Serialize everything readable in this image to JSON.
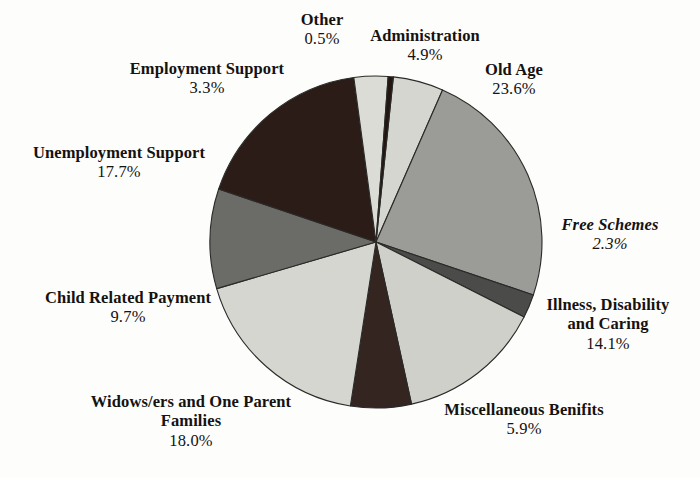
{
  "chart_data": {
    "type": "pie",
    "title": "",
    "subtitle": "",
    "xlabel": "",
    "ylabel": "",
    "legend_position": "none",
    "grid": false,
    "unit": "%",
    "center": {
      "x": 376,
      "y": 242,
      "r": 166
    },
    "start_angle_deg": -84,
    "direction": "clockwise",
    "categories": [
      "Administration",
      "Old Age",
      "Free Schemes",
      "Illness, Disability and Caring",
      "Miscellaneous Benifits",
      "Widows/ers and One Parent Families",
      "Child Related Payment",
      "Unemployment Support",
      "Employment Support",
      "Other"
    ],
    "values": [
      4.9,
      23.6,
      2.3,
      14.1,
      5.9,
      18.0,
      9.7,
      17.7,
      3.3,
      0.5
    ],
    "slices": [
      {
        "label": "Administration",
        "value": 4.9,
        "percent": "4.9%",
        "color": "#d6d6d1"
      },
      {
        "label": "Old Age",
        "value": 23.6,
        "percent": "23.6%",
        "color": "#9b9b98"
      },
      {
        "label": "Free Schemes",
        "value": 2.3,
        "percent": "2.3%",
        "color": "#4b4b49"
      },
      {
        "label": "Illness, Disability and Caring",
        "value": 14.1,
        "percent": "14.1%",
        "color": "#d0d0cb"
      },
      {
        "label": "Miscellaneous Benifits",
        "value": 5.9,
        "percent": "5.9%",
        "color": "#342520"
      },
      {
        "label": "Widows/ers and One Parent Families",
        "value": 18.0,
        "percent": "18.0%",
        "color": "#d6d6d1"
      },
      {
        "label": "Child Related Payment",
        "value": 9.7,
        "percent": "9.7%",
        "color": "#6b6b68"
      },
      {
        "label": "Unemployment Support",
        "value": 17.7,
        "percent": "17.7%",
        "color": "#2b1c17"
      },
      {
        "label": "Employment Support",
        "value": 3.3,
        "percent": "3.3%",
        "color": "#dcdcd7"
      },
      {
        "label": "Other",
        "value": 0.5,
        "percent": "0.5%",
        "color": "#231610"
      }
    ]
  },
  "labels": {
    "other": {
      "name": "Other",
      "pct": "0.5%"
    },
    "administration": {
      "name": "Administration",
      "pct": "4.9%"
    },
    "old_age": {
      "name": "Old Age",
      "pct": "23.6%"
    },
    "employment": {
      "name": "Employment Support",
      "pct": "3.3%"
    },
    "unemployment": {
      "name": "Unemployment Support",
      "pct": "17.7%"
    },
    "child_related": {
      "name": "Child Related Payment",
      "pct": "9.7%"
    },
    "widows": {
      "name": "Widows/ers and One Parent\nFamilies",
      "pct": "18.0%"
    },
    "misc": {
      "name": "Miscellaneous Benifits",
      "pct": "5.9%"
    },
    "illness": {
      "name": "Illness, Disability\nand Caring",
      "pct": "14.1%"
    },
    "free_schemes": {
      "name": "Free Schemes",
      "pct": "2.3%"
    }
  },
  "colors": {
    "background": "#fdfdfc",
    "text": "#15120f",
    "outline": "#2a2a28"
  }
}
